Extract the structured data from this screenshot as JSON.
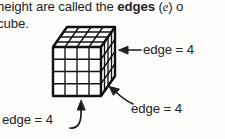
{
  "body_text": {
    "line1_pre": "height are called the ",
    "line1_bold": "edges",
    "line1_paren_open": " (",
    "line1_var": "e",
    "line1_paren_close": ") o",
    "line2": "cube."
  },
  "figure": {
    "name": "cube-diagram",
    "shape": "cube",
    "divisions_per_edge": 4,
    "faces": [
      "top",
      "front",
      "right"
    ],
    "stroke_color": "#111111",
    "fill_color": "#ffffff"
  },
  "annotations": [
    {
      "id": "label-right",
      "text": "edge = 4",
      "arrow": "arrow-left-icon",
      "points_to": "right-face"
    },
    {
      "id": "label-lower",
      "text": "edge = 4",
      "arrow": "arrow-up-left-icon",
      "points_to": "bottom-right-edge"
    },
    {
      "id": "label-bottom",
      "text": "edge = 4",
      "arrow": "curved-arrow-up-icon",
      "points_to": "bottom-front-edge"
    }
  ]
}
